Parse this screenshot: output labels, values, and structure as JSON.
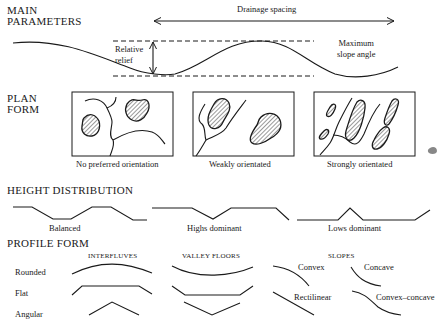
{
  "main_parameters": {
    "heading_line1": "MAIN",
    "heading_line2": "PARAMETERS",
    "drainage_spacing": "Drainage spacing",
    "relative_relief_line1": "Relative",
    "relative_relief_line2": "relief",
    "max_slope_line1": "Maximum",
    "max_slope_line2": "slope angle"
  },
  "plan_form": {
    "heading_line1": "PLAN",
    "heading_line2": "FORM",
    "panels": [
      {
        "caption": "No preferred orientation"
      },
      {
        "caption": "Weakly orientated"
      },
      {
        "caption": "Strongly orientated"
      }
    ]
  },
  "height_distribution": {
    "heading": "HEIGHT DISTRIBUTION",
    "profiles": [
      {
        "caption": "Balanced"
      },
      {
        "caption": "Highs dominant"
      },
      {
        "caption": "Lows dominant"
      }
    ]
  },
  "profile_form": {
    "heading": "PROFILE FORM",
    "columns": [
      "INTERFLUVES",
      "VALLEY FLOORS",
      "SLOPES"
    ],
    "rows": [
      "Rounded",
      "Flat",
      "Angular"
    ],
    "slope_types": [
      "Convex",
      "Concave",
      "Rectilinear",
      "Convex–concave"
    ]
  }
}
